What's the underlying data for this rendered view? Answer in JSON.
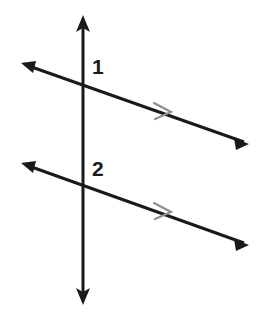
{
  "figure": {
    "background_color": "#ffffff",
    "width": 263,
    "height": 315,
    "line_color": "#1a1a1a",
    "tick_mark_color": "#8f8f8f"
  },
  "labels": {
    "angle_1": "1",
    "angle_2": "2"
  },
  "geometry": {
    "transversal": {
      "name": "vertical-transversal",
      "x": 83,
      "y_top": 15,
      "y_bottom": 305,
      "stroke_width": 3,
      "arrowheads": [
        "top",
        "bottom"
      ]
    },
    "parallel_lines": [
      {
        "name": "upper-parallel-line",
        "x1": 21,
        "y1": 63,
        "x2": 249,
        "y2": 144,
        "stroke_width": 3,
        "arrowheads": [
          "start",
          "end"
        ],
        "tick_mark": {
          "x": 163,
          "y": 110,
          "chevrons": 1
        },
        "intersection": {
          "x": 83,
          "y": 85
        }
      },
      {
        "name": "lower-parallel-line",
        "x1": 21,
        "y1": 163,
        "x2": 249,
        "y2": 245,
        "stroke_width": 3,
        "arrowheads": [
          "start",
          "end"
        ],
        "tick_mark": {
          "x": 163,
          "y": 210,
          "chevrons": 1
        },
        "intersection": {
          "x": 83,
          "y": 186
        }
      }
    ]
  }
}
